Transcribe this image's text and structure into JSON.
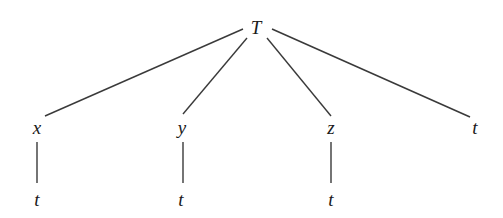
{
  "diagram": {
    "type": "tree",
    "root": {
      "label": "T"
    },
    "children": [
      {
        "label": "x",
        "child": {
          "label": "t"
        }
      },
      {
        "label": "y",
        "child": {
          "label": "t"
        }
      },
      {
        "label": "z",
        "child": {
          "label": "t"
        }
      },
      {
        "label": "t"
      }
    ]
  },
  "nodes": {
    "root": "T",
    "level1": [
      "x",
      "y",
      "z",
      "t"
    ],
    "level2": [
      "t",
      "t",
      "t"
    ]
  }
}
